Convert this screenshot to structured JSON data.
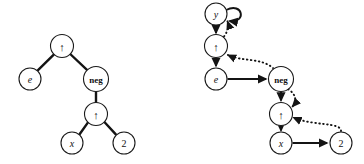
{
  "figure": {
    "title": "",
    "caption": "",
    "background_color": "#ffffff",
    "ink_color": "#141414",
    "width": 364,
    "height": 164
  },
  "panels": [
    {
      "id": "left-panel",
      "name": "expression-tree",
      "description": "undirected expression tree",
      "nodes": [
        {
          "id": "L1",
          "label": "↑",
          "label_kind": "arrow",
          "cx": 62,
          "cy": 46,
          "r": 11.5
        },
        {
          "id": "L2",
          "label": "e",
          "label_kind": "italic",
          "cx": 30,
          "cy": 79,
          "r": 11.0
        },
        {
          "id": "L3",
          "label": "neg",
          "label_kind": "word",
          "cx": 96,
          "cy": 79,
          "r": 12.5
        },
        {
          "id": "L4",
          "label": "↑",
          "label_kind": "arrow",
          "cx": 96,
          "cy": 114,
          "r": 11.5
        },
        {
          "id": "L5",
          "label": "x",
          "label_kind": "italic",
          "cx": 72,
          "cy": 143,
          "r": 11.0
        },
        {
          "id": "L6",
          "label": "2",
          "label_kind": "num",
          "cx": 124,
          "cy": 143,
          "r": 11.0
        }
      ],
      "edges": [
        {
          "from": "L1",
          "to": "L2",
          "style": "solid"
        },
        {
          "from": "L1",
          "to": "L3",
          "style": "solid"
        },
        {
          "from": "L3",
          "to": "L4",
          "style": "solid"
        },
        {
          "from": "L4",
          "to": "L5",
          "style": "solid"
        },
        {
          "from": "L4",
          "to": "L6",
          "style": "solid"
        }
      ]
    },
    {
      "id": "right-panel",
      "name": "threaded-traversal-graph",
      "description": "directed graph with solid successor arrows, dotted back arrows and a self loop",
      "nodes": [
        {
          "id": "R0",
          "label": "y",
          "label_kind": "italic",
          "cx": 216,
          "cy": 14,
          "r": 11.0
        },
        {
          "id": "R1",
          "label": "↑",
          "label_kind": "arrow",
          "cx": 216,
          "cy": 46,
          "r": 11.5
        },
        {
          "id": "R2",
          "label": "e",
          "label_kind": "italic",
          "cx": 216,
          "cy": 79,
          "r": 11.0
        },
        {
          "id": "R3",
          "label": "neg",
          "label_kind": "word",
          "cx": 281,
          "cy": 79,
          "r": 12.5
        },
        {
          "id": "R4",
          "label": "↑",
          "label_kind": "arrow",
          "cx": 281,
          "cy": 114,
          "r": 11.5
        },
        {
          "id": "R5",
          "label": "x",
          "label_kind": "italic",
          "cx": 281,
          "cy": 143,
          "r": 11.0
        },
        {
          "id": "R6",
          "label": "2",
          "label_kind": "num",
          "cx": 341,
          "cy": 143,
          "r": 11.0
        }
      ],
      "edges": [
        {
          "from": "R0",
          "to": "R0",
          "style": "self-loop",
          "note": "self loop at y"
        },
        {
          "from": "R0",
          "to": "R1",
          "style": "solid-arrow"
        },
        {
          "from": "R1",
          "to": "R2",
          "style": "solid-arrow"
        },
        {
          "from": "R2",
          "to": "R3",
          "style": "solid-arrow"
        },
        {
          "from": "R3",
          "to": "R4",
          "style": "solid-arrow"
        },
        {
          "from": "R4",
          "to": "R5",
          "style": "solid-arrow"
        },
        {
          "from": "R5",
          "to": "R6",
          "style": "solid-arrow"
        },
        {
          "from": "R1",
          "to": "R0",
          "style": "dotted-arrow"
        },
        {
          "from": "R3",
          "to": "R1",
          "style": "dotted-arrow"
        },
        {
          "from": "R3",
          "to": "R4",
          "style": "dotted-arrow"
        },
        {
          "from": "R6",
          "to": "R4",
          "style": "dotted-arrow"
        }
      ]
    }
  ]
}
